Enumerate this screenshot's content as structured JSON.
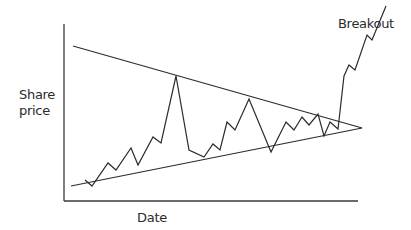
{
  "chart_data": {
    "type": "line",
    "title": "",
    "subtitle": "Symmetrical triangle chart pattern with upward breakout",
    "xlabel": "Date",
    "ylabel_lines": [
      "Share",
      "price"
    ],
    "ylabel": "Share price",
    "annotations": [
      {
        "text": "Breakout",
        "position": "top-right"
      }
    ],
    "grid": false,
    "legend": null,
    "ticks": {
      "x": [],
      "y": []
    },
    "axes": {
      "y_axis": {
        "x": 64,
        "y1": 24,
        "y2": 201
      },
      "x_axis": {
        "y": 201,
        "x1": 64,
        "x2": 358
      }
    },
    "trendlines": [
      {
        "name": "upper-resistance",
        "points": [
          [
            73,
            46
          ],
          [
            362,
            128
          ]
        ]
      },
      {
        "name": "lower-support",
        "points": [
          [
            71,
            186
          ],
          [
            362,
            128
          ]
        ]
      }
    ],
    "series": [
      {
        "name": "share-price",
        "points": [
          [
            85,
            180
          ],
          [
            92,
            186
          ],
          [
            108,
            163
          ],
          [
            116,
            170
          ],
          [
            131,
            148
          ],
          [
            138,
            165
          ],
          [
            153,
            137
          ],
          [
            161,
            143
          ],
          [
            176,
            76
          ],
          [
            189,
            150
          ],
          [
            204,
            157
          ],
          [
            213,
            144
          ],
          [
            220,
            150
          ],
          [
            227,
            122
          ],
          [
            235,
            130
          ],
          [
            249,
            99
          ],
          [
            271,
            152
          ],
          [
            286,
            122
          ],
          [
            294,
            130
          ],
          [
            302,
            117
          ],
          [
            309,
            125
          ],
          [
            318,
            114
          ],
          [
            324,
            136
          ],
          [
            330,
            122
          ],
          [
            338,
            129
          ],
          [
            344,
            76
          ],
          [
            349,
            65
          ],
          [
            355,
            70
          ],
          [
            367,
            35
          ],
          [
            372,
            40
          ],
          [
            386,
            6
          ]
        ]
      }
    ],
    "colors": {
      "line": "#2b2b2b",
      "axis": "#3a3a3a",
      "background": "#ffffff"
    }
  },
  "labels": {
    "y_line1": "Share",
    "y_line2": "price",
    "x": "Date",
    "annotation": "Breakout"
  }
}
